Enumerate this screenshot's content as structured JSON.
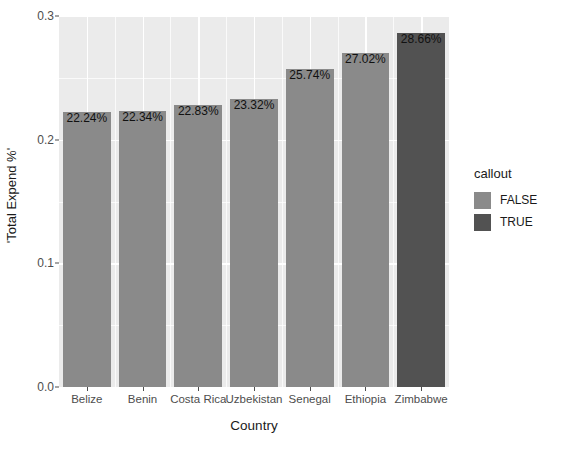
{
  "chart_data": {
    "type": "bar",
    "title": "",
    "xlabel": "Country",
    "ylabel": "'Total Expend %'",
    "categories": [
      "Belize",
      "Benin",
      "Costa Rica",
      "Uzbekistan",
      "Senegal",
      "Ethiopia",
      "Zimbabwe"
    ],
    "values": [
      0.2224,
      0.2234,
      0.2283,
      0.2332,
      0.2574,
      0.2702,
      0.2866
    ],
    "data_labels": [
      "22.24%",
      "22.34%",
      "22.83%",
      "23.32%",
      "25.74%",
      "27.02%",
      "28.66%"
    ],
    "callout": [
      false,
      false,
      false,
      false,
      false,
      false,
      true
    ],
    "ylim": [
      0.0,
      0.3
    ],
    "y_ticks": [
      "0.0",
      "0.1",
      "0.2",
      "0.3"
    ],
    "y_tick_values": [
      0.0,
      0.1,
      0.2,
      0.3
    ],
    "y_minor_tick_values": [
      0.05,
      0.15,
      0.25
    ],
    "grid": true,
    "legend_position": "right"
  },
  "legend": {
    "title": "callout",
    "entries": [
      {
        "label": "FALSE",
        "color": "#8a8a8a"
      },
      {
        "label": "TRUE",
        "color": "#525252"
      }
    ]
  },
  "colors": {
    "panel_background": "#ebebeb",
    "grid_line": "#ffffff",
    "bar_false": "#8a8a8a",
    "bar_true": "#525252",
    "axis_text": "#4d4d4d",
    "title_text": "#1a1a1a",
    "page_background": "#ffffff"
  }
}
